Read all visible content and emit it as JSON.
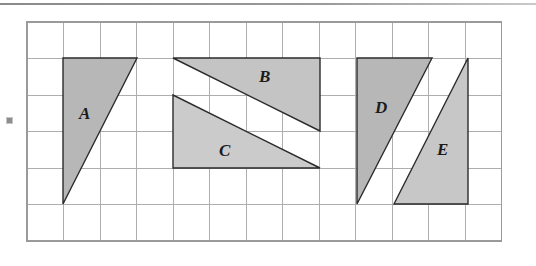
{
  "figure": {
    "name": "shaded-triangles-on-grid",
    "top_rule": true,
    "bullet_marker": "square-bullet"
  },
  "grid": {
    "origin_x": 27,
    "origin_y": 22,
    "cell": 36.5,
    "cols": 13,
    "rows": 6,
    "line_color": "#aeaeae",
    "border_color": "#9a9a9a",
    "grid_on": true
  },
  "style": {
    "fill_dark": "#b9b9b9",
    "fill_light": "#cfcfcf",
    "stroke": "#2b2b2b",
    "background": "#ffffff",
    "label_color": "#1b1b1b"
  },
  "shapes": [
    {
      "id": "triangle-a",
      "label": "A",
      "fill": "#b7b7b7",
      "points": "63,58 137,58 63,204",
      "label_x": 79,
      "label_y": 105
    },
    {
      "id": "triangle-b",
      "label": "B",
      "fill": "#c4c4c4",
      "points": "173,58 320,58 320,131",
      "label_x": 259,
      "label_y": 68
    },
    {
      "id": "triangle-c",
      "label": "C",
      "fill": "#cbcbcb",
      "points": "173,95 320,168 173,168",
      "label_x": 219,
      "label_y": 142
    },
    {
      "id": "triangle-d",
      "label": "D",
      "fill": "#b7b7b7",
      "points": "357,58 432,58 357,204",
      "label_x": 375,
      "label_y": 99
    },
    {
      "id": "triangle-e",
      "label": "E",
      "fill": "#c7c7c7",
      "points": "468,58 468,204 394,204",
      "label_x": 437,
      "label_y": 141
    }
  ]
}
